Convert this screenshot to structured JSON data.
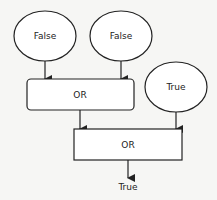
{
  "diagram": {
    "inputs": [
      {
        "label": "False"
      },
      {
        "label": "False"
      },
      {
        "label": "True"
      }
    ],
    "gates": [
      {
        "label": "OR"
      },
      {
        "label": "OR"
      }
    ],
    "output": {
      "label": "True"
    },
    "colors": {
      "stroke": "#222222",
      "background": "#f6f6f4",
      "fill": "#ffffff"
    }
  }
}
